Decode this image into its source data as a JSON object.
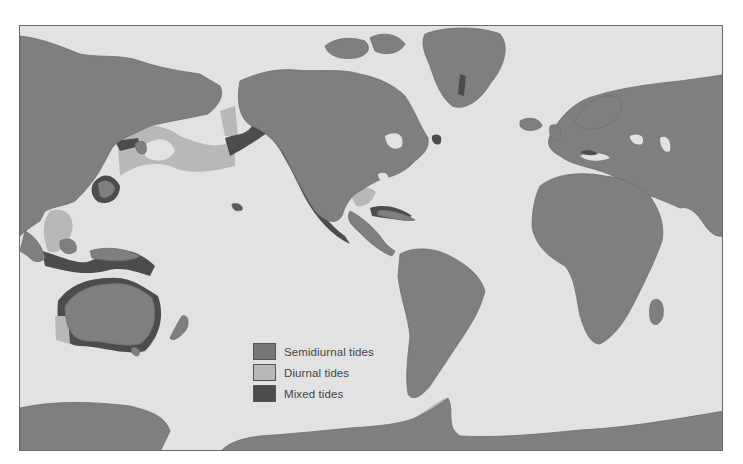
{
  "figure": {
    "type": "world-map"
  },
  "colors": {
    "ocean": "#e2e2e2",
    "land": "#7f7f7f",
    "semidiurnal": "#777777",
    "diurnal": "#b8b8b8",
    "mixed": "#4c4c4c",
    "frame": "#6a6a6a"
  },
  "legend": {
    "items": [
      {
        "key": "semidiurnal",
        "label": "Semidiurnal tides",
        "color": "#777777"
      },
      {
        "key": "diurnal",
        "label": "Diurnal tides",
        "color": "#b8b8b8"
      },
      {
        "key": "mixed",
        "label": "Mixed tides",
        "color": "#4c4c4c"
      }
    ]
  },
  "regions": {
    "diurnal": [
      "Sea of Okhotsk / Bering Sea arc",
      "Gulf of Mexico",
      "South China Sea",
      "Western Australia",
      "Antarctic Peninsula"
    ],
    "mixed": [
      "Japan / Korea",
      "Gulf of Alaska",
      "Pacific coast of North America",
      "Caribbean",
      "Indonesia / New Guinea",
      "Mediterranean",
      "Australia north & south coasts"
    ],
    "semidiurnal": [
      "Atlantic coasts",
      "Africa",
      "South America",
      "Europe",
      "Greenland",
      "Indian Ocean"
    ]
  }
}
